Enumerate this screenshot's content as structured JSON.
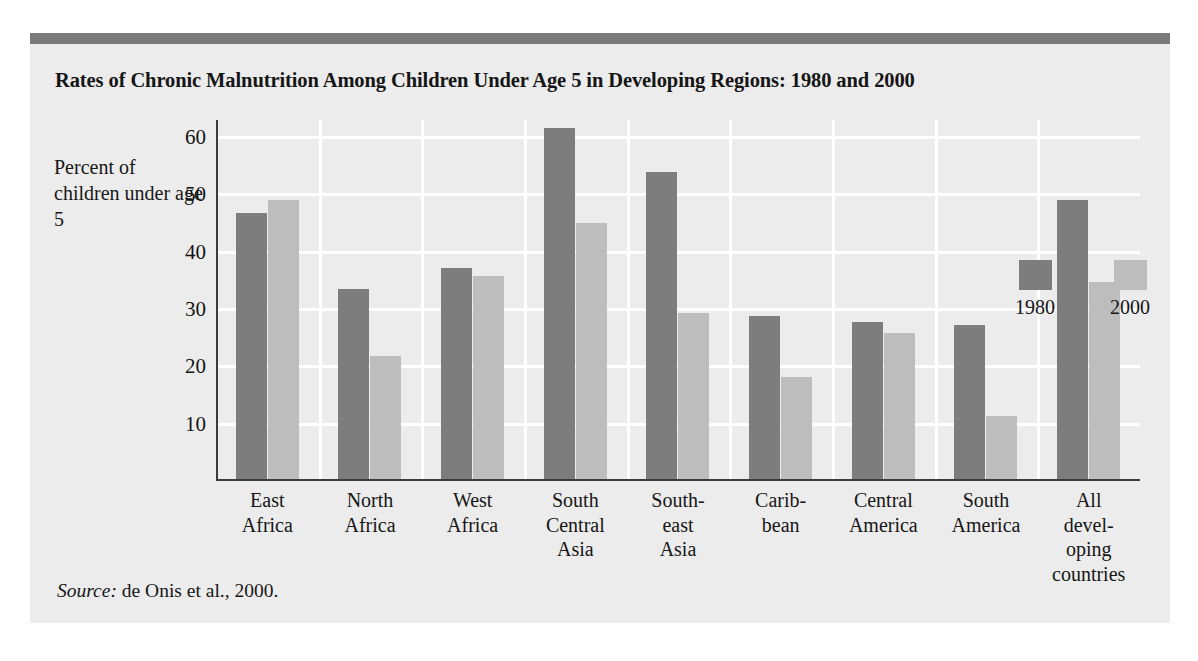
{
  "figure": {
    "title": "Rates of Chronic Malnutrition Among Children Under Age 5 in Developing Regions: 1980 and 2000",
    "y_axis_caption": "Percent of children under age 5",
    "source_prefix": "Source:",
    "source_text": " de Onis et al., 2000.",
    "colors": {
      "series_1980": "#7d7d7d",
      "series_2000": "#bdbdbd",
      "panel_background": "#ececec",
      "top_rule": "#7a7a7a",
      "gridline": "#ffffff",
      "axis": "#3b3b3b"
    }
  },
  "chart_data": {
    "type": "bar",
    "title": "Rates of Chronic Malnutrition Among Children Under Age 5 in Developing Regions: 1980 and 2000",
    "xlabel": "",
    "ylabel": "Percent of children under age 5",
    "ylim": [
      0,
      63
    ],
    "yticks": [
      10,
      20,
      30,
      40,
      50,
      60
    ],
    "ytick_labels": [
      "10",
      "20",
      "30",
      "40",
      "50",
      "60"
    ],
    "grid": "horizontal-and-vertical-white",
    "legend_position": "inside-upper-right",
    "categories": [
      "East Africa",
      "North Africa",
      "West Africa",
      "South Central Asia",
      "South-east Asia",
      "Caribbean",
      "Central America",
      "South America",
      "All developing countries"
    ],
    "category_label_lines": [
      [
        "East",
        "Africa"
      ],
      [
        "North",
        "Africa"
      ],
      [
        "West",
        "Africa"
      ],
      [
        "South",
        "Central",
        "Asia"
      ],
      [
        "South-",
        "east",
        "Asia"
      ],
      [
        "Carib-",
        "bean"
      ],
      [
        "Central",
        "America"
      ],
      [
        "South",
        "America"
      ],
      [
        "All",
        "devel-",
        "oping",
        "countries"
      ]
    ],
    "series": [
      {
        "name": "1980",
        "color": "#7d7d7d",
        "values": [
          46.5,
          33.2,
          36.9,
          61.3,
          53.6,
          28.4,
          27.4,
          26.9,
          48.7
        ]
      },
      {
        "name": "2000",
        "color": "#bdbdbd",
        "values": [
          48.7,
          21.4,
          35.4,
          44.6,
          28.9,
          17.8,
          25.5,
          11.0,
          34.4
        ]
      }
    ]
  },
  "legend": {
    "entries": [
      {
        "label": "1980",
        "swatch": "dark-gray-swatch"
      },
      {
        "label": "2000",
        "swatch": "light-gray-swatch"
      }
    ]
  }
}
